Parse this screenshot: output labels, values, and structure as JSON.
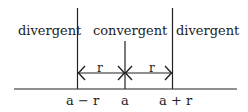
{
  "diagram": {
    "regions": [
      {
        "label": "divergent",
        "position": "left"
      },
      {
        "label": "convergent",
        "position": "center"
      },
      {
        "label": "divergent",
        "position": "right"
      }
    ],
    "radius_labels": [
      "r",
      "r"
    ],
    "axis_ticks": [
      {
        "label": "a − r"
      },
      {
        "label": "a"
      },
      {
        "label": "a + r"
      }
    ],
    "colors": {
      "line": "#222222",
      "background": "#ffffff"
    }
  }
}
